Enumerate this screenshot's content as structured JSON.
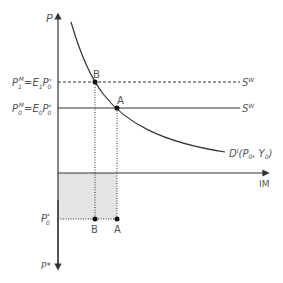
{
  "diagram": {
    "type": "economics-import-demand-diagram",
    "axes": {
      "vertical_top_label": "P",
      "horizontal_label": "IM",
      "vertical_bottom_label": "P*"
    },
    "price_levels": {
      "p1m": {
        "main": "P",
        "sub": "1",
        "sup": "M",
        "eq": "=E",
        "eq_sub": "1",
        "p": "P",
        "p_sup": "*",
        "p_sub": "0"
      },
      "p0m": {
        "main": "P",
        "sub": "0",
        "sup": "M",
        "eq": "=E",
        "eq_sub": "0",
        "p": "P",
        "p_sup": "*",
        "p_sub": "0"
      },
      "p0star": {
        "main": "P",
        "sup": "*",
        "sub": "0"
      }
    },
    "curves": {
      "supply_prime": {
        "main": "S",
        "sup": "W′",
        "style": "dashed"
      },
      "supply": {
        "main": "S",
        "sup": "W",
        "style": "solid"
      },
      "demand": {
        "main": "D",
        "sup": "I",
        "args": "(P",
        "args_sub0": "0",
        "args_mid": ", Y",
        "args_sub1": "0",
        "args_end": ")"
      }
    },
    "points": {
      "B": {
        "label": "B",
        "x": 95,
        "y": 82
      },
      "A": {
        "label": "A",
        "x": 117,
        "y": 108
      }
    },
    "bottom_points": {
      "B": {
        "label": "B"
      },
      "A": {
        "label": "A"
      }
    },
    "colors": {
      "line": "#333333",
      "shade": "#e4e4e4",
      "text": "#555555"
    }
  }
}
